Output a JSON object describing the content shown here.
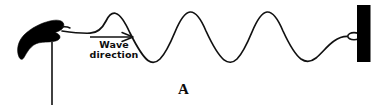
{
  "figure": {
    "panel_letter": "A",
    "annotation": {
      "name": "wave-direction",
      "line1": "Wave",
      "line2": "direction"
    },
    "colors": {
      "background": "#ffffff",
      "ink": "#111111",
      "rope": "#111111",
      "hand_fill": "#000000",
      "post_fill": "#000000"
    },
    "elements": {
      "hand_name": "hand-gripping-rope",
      "arm_name": "arm-line",
      "rope_name": "rope-wave-curve",
      "post_name": "wall-post",
      "ring_name": "attachment-ring",
      "arrow_name": "direction-arrow"
    },
    "geometry": {
      "width": 382,
      "height": 106,
      "wave_peaks_x": [
        110,
        193,
        275
      ],
      "wave_peaks_y": [
        13,
        12,
        12
      ],
      "wave_troughs_x": [
        152,
        234,
        316
      ],
      "wave_troughs_y": [
        61,
        61,
        60
      ],
      "baseline_y": 37,
      "rope_start": [
        62,
        34
      ],
      "rope_end": [
        355,
        38
      ],
      "post_rect": [
        357,
        5,
        14,
        57
      ],
      "arm_line": [
        52,
        44,
        52,
        104
      ],
      "arrow_from": [
        90,
        37
      ],
      "arrow_to": [
        133,
        37
      ]
    }
  }
}
